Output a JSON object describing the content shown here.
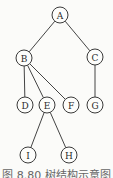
{
  "diagram": {
    "type": "tree",
    "nodes": [
      {
        "id": "A",
        "label": "A",
        "x": 60,
        "y": 15
      },
      {
        "id": "B",
        "label": "B",
        "x": 24,
        "y": 58
      },
      {
        "id": "C",
        "label": "C",
        "x": 95,
        "y": 57
      },
      {
        "id": "D",
        "label": "D",
        "x": 25,
        "y": 105
      },
      {
        "id": "E",
        "label": "E",
        "x": 47,
        "y": 105
      },
      {
        "id": "F",
        "label": "F",
        "x": 71,
        "y": 105
      },
      {
        "id": "G",
        "label": "G",
        "x": 95,
        "y": 105
      },
      {
        "id": "I",
        "label": "I",
        "x": 28,
        "y": 155
      },
      {
        "id": "H",
        "label": "H",
        "x": 69,
        "y": 155
      }
    ],
    "edges": [
      [
        "A",
        "B"
      ],
      [
        "A",
        "C"
      ],
      [
        "B",
        "D"
      ],
      [
        "B",
        "E"
      ],
      [
        "B",
        "F"
      ],
      [
        "C",
        "G"
      ],
      [
        "E",
        "I"
      ],
      [
        "E",
        "H"
      ]
    ]
  },
  "caption": "图 8.80  树结构示意图"
}
